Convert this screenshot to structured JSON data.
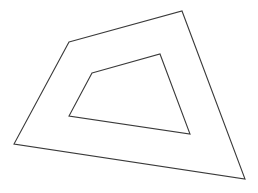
{
  "diagram": {
    "type": "nested-quadrilaterals",
    "width": 258,
    "height": 193,
    "background": "#ffffff",
    "stroke_color": "#3a3a3a",
    "shapes": [
      {
        "name": "outer-quadrilateral",
        "points": [
          [
            69,
            42
          ],
          [
            182,
            11
          ],
          [
            245,
            179
          ],
          [
            14,
            144
          ]
        ]
      },
      {
        "name": "inner-quadrilateral",
        "points": [
          [
            92,
            73
          ],
          [
            160,
            54
          ],
          [
            190,
            134
          ],
          [
            69,
            116
          ]
        ]
      }
    ]
  }
}
